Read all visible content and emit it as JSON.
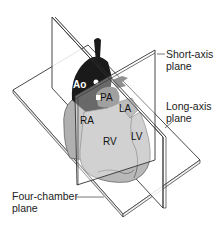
{
  "diagram": {
    "structures": [
      {
        "id": "ao",
        "label": "Ao",
        "color": "#1a1a1a",
        "text_color": "#ffffff"
      },
      {
        "id": "pa",
        "label": "PA",
        "color": "#6e6e6e",
        "text_color": "#111111"
      },
      {
        "id": "la",
        "label": "LA",
        "color": "#9a9a9a",
        "text_color": "#111111"
      },
      {
        "id": "ra",
        "label": "RA",
        "color": "#b0b0b0",
        "text_color": "#111111"
      },
      {
        "id": "rv",
        "label": "RV",
        "color": "#b8b8b8",
        "text_color": "#111111"
      },
      {
        "id": "lv",
        "label": "LV",
        "color": "#a8a8a8",
        "text_color": "#111111"
      }
    ],
    "planes": [
      {
        "id": "short_axis",
        "label_line1": "Short-axis",
        "label_line2": "plane"
      },
      {
        "id": "long_axis",
        "label_line1": "Long-axis",
        "label_line2": "plane"
      },
      {
        "id": "four_chamber",
        "label_line1": "Four-chamber",
        "label_line2": "plane"
      }
    ],
    "colors": {
      "plane_fill": "#ffffff",
      "plane_stroke": "#333333",
      "leader_line": "#555555"
    }
  }
}
